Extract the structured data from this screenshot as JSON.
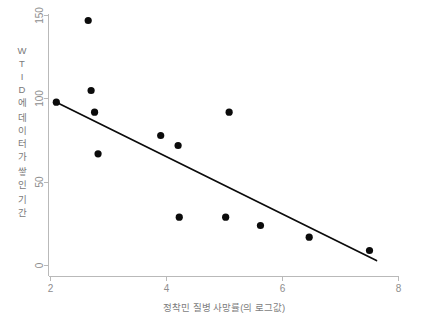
{
  "chart_data": {
    "type": "scatter",
    "title": "",
    "xlabel": "정착민 질병 사망률(의 로그값)",
    "ylabel": "WTID에 데이터가 쌓인 기간",
    "ylabel_chars": [
      "W",
      "T",
      "I",
      "D",
      "에",
      "데",
      "이",
      "터",
      "가",
      "쌓",
      "인",
      "기",
      "간"
    ],
    "xlim": [
      2,
      8
    ],
    "ylim": [
      0,
      150
    ],
    "xticks": [
      2,
      4,
      6,
      8
    ],
    "xtick_labels": [
      "2",
      "4",
      "6",
      "8"
    ],
    "yticks": [
      0,
      50,
      100,
      150
    ],
    "ytick_labels": [
      "0",
      "50",
      "100",
      "150"
    ],
    "grid": false,
    "legend": null,
    "point_color": "#0b0b0b",
    "line_color": "#0b0b0b",
    "axis_color": "#b9b9b9",
    "points": [
      {
        "x": 2.1,
        "y": 98
      },
      {
        "x": 2.65,
        "y": 147
      },
      {
        "x": 2.7,
        "y": 105
      },
      {
        "x": 2.76,
        "y": 92
      },
      {
        "x": 2.82,
        "y": 67
      },
      {
        "x": 3.9,
        "y": 78
      },
      {
        "x": 4.2,
        "y": 72
      },
      {
        "x": 4.22,
        "y": 29
      },
      {
        "x": 5.02,
        "y": 29
      },
      {
        "x": 5.08,
        "y": 92
      },
      {
        "x": 5.62,
        "y": 24
      },
      {
        "x": 6.46,
        "y": 17
      },
      {
        "x": 7.5,
        "y": 9
      }
    ],
    "fit_line": {
      "name": "regression-line",
      "x1": 2.1,
      "y1": 98,
      "x2": 7.62,
      "y2": 3
    }
  }
}
